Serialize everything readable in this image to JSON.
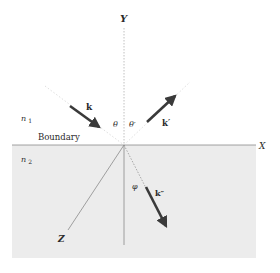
{
  "diagram": {
    "colors": {
      "background": "#ffffff",
      "lower_medium_fill": "#ececec",
      "axis_line": "#8a8a8a",
      "arrow": "#3a3a3a",
      "text": "#2a2a2a"
    },
    "axes": {
      "y_label": "Y",
      "x_label": "X",
      "z_label": "Z"
    },
    "media": {
      "upper_label": "n",
      "upper_sub": "1",
      "lower_label": "n",
      "lower_sub": "2",
      "boundary_label": "Boundary"
    },
    "vectors": {
      "incident_label": "k",
      "reflected_label": "k′",
      "transmitted_label": "k″"
    },
    "angles": {
      "incidence": "θ",
      "reflection": "θ′",
      "refraction": "φ"
    }
  }
}
